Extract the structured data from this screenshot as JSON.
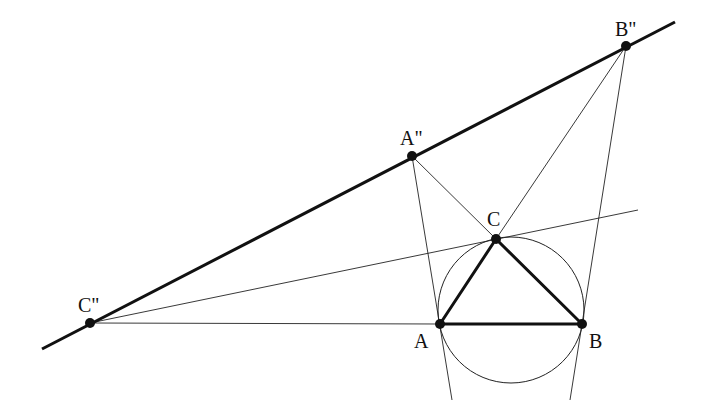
{
  "diagram": {
    "colors": {
      "stroke": "#111111",
      "background": "#ffffff"
    },
    "points": {
      "A": {
        "label": "A",
        "x": 440,
        "y": 324
      },
      "B": {
        "label": "B",
        "x": 582,
        "y": 324
      },
      "C": {
        "label": "C",
        "x": 496,
        "y": 239
      },
      "A2": {
        "label": "A''",
        "x": 412,
        "y": 156
      },
      "B2": {
        "label": "B''",
        "x": 626,
        "y": 46
      },
      "C2": {
        "label": "C''",
        "x": 90,
        "y": 323
      }
    },
    "circle": {
      "cx": 511,
      "cy": 310,
      "r": 73
    },
    "labels": {
      "A": "A",
      "B": "B",
      "C": "C",
      "A2": "A\"",
      "B2": "B\"",
      "C2": "C\""
    }
  }
}
